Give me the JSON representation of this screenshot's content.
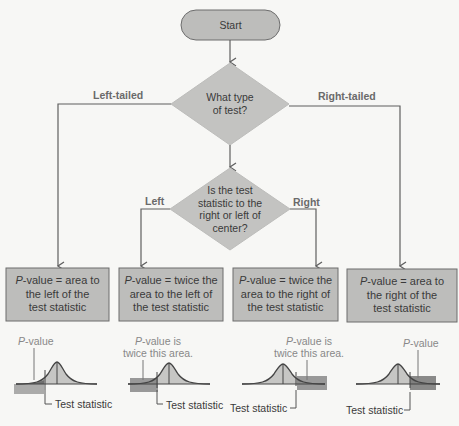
{
  "start": {
    "label": "Start"
  },
  "decision1": {
    "lines": [
      "What type",
      "of test?"
    ],
    "left_branch": "Left-tailed",
    "right_branch": "Right-tailed"
  },
  "decision2": {
    "lines": [
      "Is the test",
      "statistic to the",
      "right or left of",
      "center?"
    ],
    "left_branch": "Left",
    "right_branch": "Right"
  },
  "outcomes": [
    {
      "p": "P",
      "lines": [
        "-value = area to",
        "the left of the",
        "test statistic"
      ]
    },
    {
      "p": "P",
      "lines": [
        "-value = twice the",
        "area to the left of",
        "the test statistic"
      ]
    },
    {
      "p": "P",
      "lines": [
        "-value = twice the",
        "area to the right of",
        "the test statistic"
      ]
    },
    {
      "p": "P",
      "lines": [
        "-value = area to",
        "the right of the",
        "test statistic"
      ]
    }
  ],
  "curve_notes": [
    {
      "p": "P",
      "rest": "-value",
      "line2": ""
    },
    {
      "p": "P",
      "rest": "-value is",
      "line2": "twice this area."
    },
    {
      "p": "P",
      "rest": "-value is",
      "line2": "twice this area."
    },
    {
      "p": "P",
      "rest": "-value",
      "line2": ""
    }
  ],
  "test_statistic_label": "Test statistic",
  "colors": {
    "node_fill": "#bdbdbb",
    "node_stroke": "#6d6d6d",
    "line": "#5f5f5f",
    "curve_fill": "#c6c6c4",
    "tail_fill": "#6e6e6e"
  }
}
